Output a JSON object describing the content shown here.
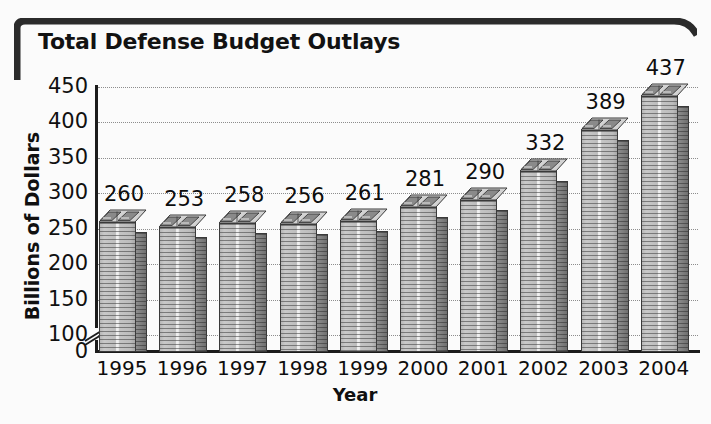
{
  "title": "Total Defense Budget Outlays",
  "colors": {
    "frame": "#2b2b2b",
    "text": "#101010",
    "bar_front": "#c4c4c4",
    "bar_side": "#7d7d7d",
    "gridline": "#8d8d8d",
    "background": "#fbfbfb"
  },
  "chart_data": {
    "type": "bar",
    "title": "Total Defense Budget Outlays",
    "subtitle": "",
    "xlabel": "Year",
    "ylabel": "Billions of Dollars",
    "categories": [
      "1995",
      "1996",
      "1997",
      "1998",
      "1999",
      "2000",
      "2001",
      "2002",
      "2003",
      "2004"
    ],
    "values": [
      260,
      253,
      258,
      256,
      261,
      281,
      290,
      332,
      389,
      437
    ],
    "data_labels": [
      "260",
      "253",
      "258",
      "256",
      "261",
      "281",
      "290",
      "332",
      "389",
      "437"
    ],
    "yticks": [
      0,
      100,
      150,
      200,
      250,
      300,
      350,
      400,
      450
    ],
    "ytick_labels": [
      "0",
      "100",
      "150",
      "200",
      "250",
      "300",
      "350",
      "400",
      "450"
    ],
    "ylim": [
      0,
      450
    ],
    "y_axis_break": true,
    "y_axis_break_note": "axis broken between 0 and 100",
    "grid": true,
    "grid_style": "dotted horizontal",
    "legend": null,
    "legend_position": "none",
    "bar_style": "3d stacked-banknote columns",
    "units": "Billions of Dollars"
  },
  "icons": {
    "axis_break": "axis-break-icon",
    "money_stack": "money-stack-icon"
  }
}
